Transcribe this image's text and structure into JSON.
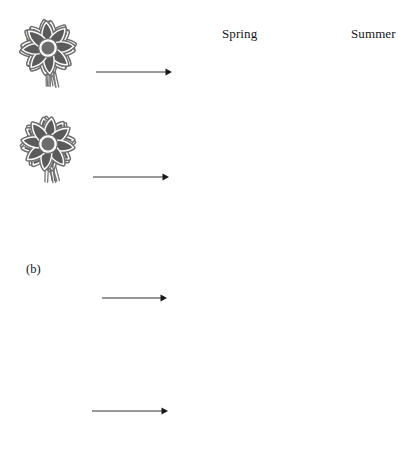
{
  "figure": {
    "width": 398,
    "height": 469,
    "background": "#ffffff",
    "columns": [
      {
        "id": "spring",
        "label": "Spring",
        "x": 222,
        "y": 27
      },
      {
        "id": "summer",
        "label": "Summer",
        "x": 351,
        "y": 27
      }
    ],
    "panels": [
      {
        "id": "a",
        "label": "(a)",
        "x": 26,
        "y": 31
      },
      {
        "id": "b",
        "label": "(b)",
        "x": 26,
        "y": 263
      }
    ],
    "colors": {
      "petal_fill": "#5b5b5b",
      "petal_outline": "#ffffff",
      "petal_edge": "#6e6e6e",
      "center_fill": "#6d6d6d",
      "center_ring": "#ffffff",
      "stem": "#7a7a7a",
      "empty_petal_fill": "#ffffff",
      "empty_outline": "#6a6a6a",
      "arrow": "#1a1a1a",
      "text": "#16161a"
    },
    "rows": [
      {
        "id": "row-1",
        "panel": "a",
        "start_flower": {
          "name": "flower-dark",
          "type": "shaded",
          "cx": 46,
          "cy": 72,
          "scale": 1.0,
          "rotate": -8
        },
        "arrow": {
          "name": "arrow-right",
          "x1": 96,
          "x2": 172,
          "y": 72
        },
        "result_flower": {
          "name": "flower-dark",
          "type": "shaded",
          "cx": 220,
          "cy": 72,
          "scale": 0.97,
          "rotate": -4,
          "column": "spring"
        },
        "summer_flower": null
      },
      {
        "id": "row-2",
        "panel": "a",
        "start_flower": {
          "name": "flower-dark",
          "type": "shaded",
          "cx": 46,
          "cy": 175,
          "scale": 0.95,
          "rotate": 4,
          "column": "start"
        },
        "arrow": {
          "name": "arrow-right",
          "x1": 93,
          "x2": 169,
          "y": 177
        },
        "result_flower": null,
        "summer_flower": {
          "name": "flower-dark",
          "type": "shaded",
          "cx": 340,
          "cy": 172,
          "scale": 0.95,
          "rotate": -10,
          "column": "summer"
        }
      },
      {
        "id": "row-3",
        "panel": "b",
        "start_flower": {
          "name": "flower-dark",
          "type": "shaded",
          "cx": 48,
          "cy": 298,
          "scale": 0.95,
          "rotate": 6
        },
        "arrow": {
          "name": "arrow-right",
          "x1": 102,
          "x2": 167,
          "y": 298
        },
        "result_flower": {
          "name": "flower-empty",
          "type": "outline",
          "cx": 228,
          "cy": 300,
          "scale": 0.92,
          "rotate": -3,
          "column": "spring"
        },
        "summer_flower": null
      },
      {
        "id": "row-4",
        "panel": "b",
        "start_flower": {
          "name": "flower-dark",
          "type": "shaded",
          "cx": 48,
          "cy": 412,
          "scale": 0.95,
          "rotate": -4
        },
        "arrow": {
          "name": "arrow-right",
          "x1": 92,
          "x2": 168,
          "y": 411
        },
        "result_flower": {
          "name": "flower-dark",
          "type": "shaded",
          "cx": 228,
          "cy": 412,
          "scale": 0.95,
          "rotate": 8,
          "column": "spring"
        },
        "summer_flower": null
      }
    ],
    "flower_geometry": {
      "petal_count": 8,
      "petal_length": 27,
      "petal_width": 10,
      "center_radius": 7.5,
      "stem_length": 34
    }
  }
}
